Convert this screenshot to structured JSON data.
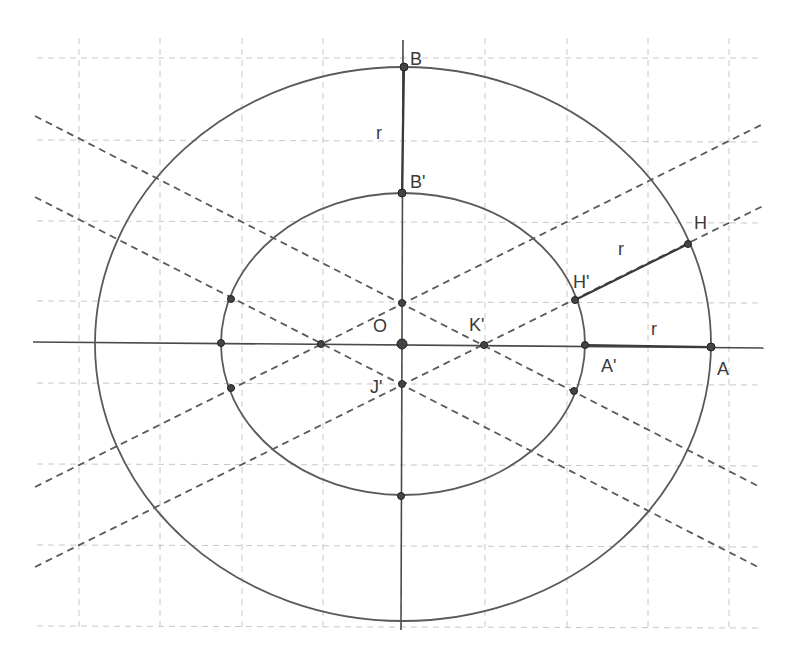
{
  "diagram": {
    "type": "geometric construction: two concentric ellipses with equal radial offset r",
    "colors": {
      "background": "#ffffff",
      "grid": "#c8c8c8",
      "lines": "#5a5a5a",
      "points": "#444444",
      "text": "#3a3a3a"
    },
    "labels": {
      "B": "B",
      "B_prime": "B'",
      "O": "O",
      "K_prime": "K'",
      "J_prime": "J'",
      "H": "H",
      "H_prime": "H'",
      "A": "A",
      "A_prime": "A'",
      "r_vertical": "r",
      "r_oblique": "r",
      "r_horizontal": "r"
    },
    "segments_equal_to_r": [
      "BB'",
      "HH'",
      "AA'"
    ],
    "points": [
      "A",
      "A'",
      "B",
      "B'",
      "H",
      "H'",
      "O",
      "K'",
      "J'"
    ]
  }
}
